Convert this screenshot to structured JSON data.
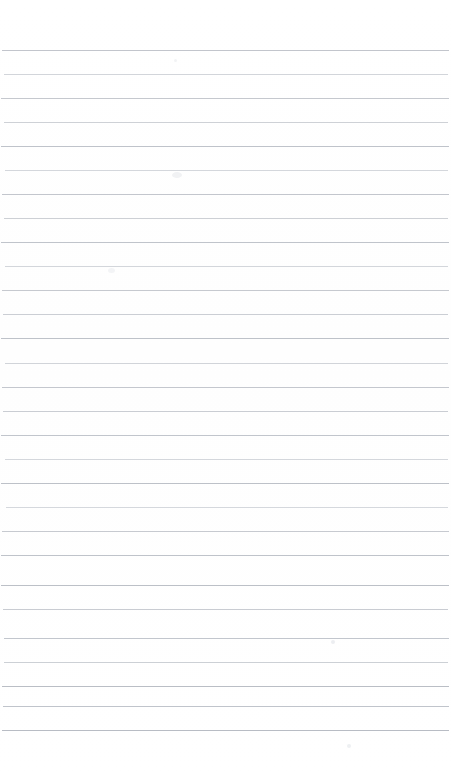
{
  "document": {
    "title": "Blank Ruled Notebook Page",
    "type": "scanned-lined-paper",
    "description": "Scanned blank lined notebook page with no handwriting or printed text",
    "width_px": 451,
    "height_px": 781,
    "background_color": "#ffffff",
    "has_text_content": "false",
    "visible_text": ""
  },
  "ruling": {
    "line_count": 29,
    "first_line_y": 50,
    "line_spacing_px": 24,
    "line_thickness_px": 1,
    "line_left_x": 2,
    "line_right_x": 449,
    "line_color": "#c9ccd2",
    "line_color_dark": "#b5b9c1",
    "line_color_light": "#dcdee2",
    "top_margin_px": 50,
    "bottom_margin_px": 51,
    "lines": [
      {
        "index": 1,
        "y": 50,
        "color": "#c2c5cc",
        "left": 2,
        "right": 449
      },
      {
        "index": 2,
        "y": 74,
        "color": "#d2d5da",
        "left": 4,
        "right": 448
      },
      {
        "index": 3,
        "y": 98,
        "color": "#c5c8ce",
        "left": 1,
        "right": 449
      },
      {
        "index": 4,
        "y": 122,
        "color": "#ced1d6",
        "left": 4,
        "right": 448
      },
      {
        "index": 5,
        "y": 146,
        "color": "#bfc3ca",
        "left": 1,
        "right": 449
      },
      {
        "index": 6,
        "y": 170,
        "color": "#d4d7dc",
        "left": 5,
        "right": 448
      },
      {
        "index": 7,
        "y": 194,
        "color": "#c3c6cd",
        "left": 2,
        "right": 449
      },
      {
        "index": 8,
        "y": 218,
        "color": "#cdd0d5",
        "left": 4,
        "right": 448
      },
      {
        "index": 9,
        "y": 242,
        "color": "#c0c4cb",
        "left": 1,
        "right": 449
      },
      {
        "index": 10,
        "y": 266,
        "color": "#d3d6db",
        "left": 5,
        "right": 448
      },
      {
        "index": 11,
        "y": 290,
        "color": "#c6c9cf",
        "left": 2,
        "right": 449
      },
      {
        "index": 12,
        "y": 314,
        "color": "#cbced4",
        "left": 3,
        "right": 448
      },
      {
        "index": 13,
        "y": 338,
        "color": "#bec2c9",
        "left": 1,
        "right": 449
      },
      {
        "index": 14,
        "y": 363,
        "color": "#d1d4d9",
        "left": 5,
        "right": 448
      },
      {
        "index": 15,
        "y": 387,
        "color": "#c4c7ce",
        "left": 2,
        "right": 449
      },
      {
        "index": 16,
        "y": 411,
        "color": "#cacdd3",
        "left": 3,
        "right": 448
      },
      {
        "index": 17,
        "y": 435,
        "color": "#c1c5cc",
        "left": 1,
        "right": 449
      },
      {
        "index": 18,
        "y": 459,
        "color": "#d4d7dc",
        "left": 5,
        "right": 448
      },
      {
        "index": 19,
        "y": 483,
        "color": "#bdc1c8",
        "left": 1,
        "right": 449
      },
      {
        "index": 20,
        "y": 507,
        "color": "#d5d8dd",
        "left": 6,
        "right": 448
      },
      {
        "index": 21,
        "y": 531,
        "color": "#c7cad0",
        "left": 2,
        "right": 449
      },
      {
        "index": 22,
        "y": 555,
        "color": "#bfc3ca",
        "left": 1,
        "right": 449
      },
      {
        "index": 23,
        "y": 585,
        "color": "#bcc0c7",
        "left": 1,
        "right": 449
      },
      {
        "index": 24,
        "y": 609,
        "color": "#c9ccd2",
        "left": 3,
        "right": 448
      },
      {
        "index": 25,
        "y": 638,
        "color": "#c2c6cd",
        "left": 4,
        "right": 449
      },
      {
        "index": 26,
        "y": 662,
        "color": "#ccd0d5",
        "left": 4,
        "right": 448
      },
      {
        "index": 27,
        "y": 686,
        "color": "#babec5",
        "left": 2,
        "right": 449
      },
      {
        "index": 28,
        "y": 706,
        "color": "#c0c4cb",
        "left": 3,
        "right": 449
      },
      {
        "index": 29,
        "y": 730,
        "color": "#b8bcc4",
        "left": 2,
        "right": 449
      }
    ]
  },
  "artifacts": [
    {
      "name": "scan-smudge-upper",
      "x": 172,
      "y": 172,
      "w": 10,
      "h": 6,
      "color": "#f1f2f4"
    },
    {
      "name": "scan-smudge-mid",
      "x": 108,
      "y": 268,
      "w": 7,
      "h": 5,
      "color": "#f3f4f6"
    },
    {
      "name": "scan-speck-lower-right",
      "x": 331,
      "y": 640,
      "w": 4,
      "h": 4,
      "color": "#eceef1"
    },
    {
      "name": "scan-speck-bottom",
      "x": 347,
      "y": 744,
      "w": 4,
      "h": 4,
      "color": "#eef0f2"
    },
    {
      "name": "scan-speck-top",
      "x": 174,
      "y": 59,
      "w": 3,
      "h": 3,
      "color": "#f2f3f5"
    }
  ]
}
